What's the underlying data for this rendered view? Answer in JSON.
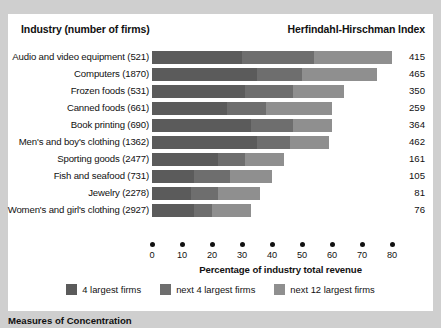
{
  "header": {
    "industry_title": "Industry (number of firms)",
    "hhi_title": "Herfindahl-Hirschman Index"
  },
  "caption": "Measures of Concentration",
  "legend": {
    "items": [
      {
        "label": "4 largest firms",
        "color": "#5b5b5b",
        "key": "top4"
      },
      {
        "label": "next 4 largest firms",
        "color": "#6e6e6e",
        "key": "next4"
      },
      {
        "label": "next 12 largest firms",
        "color": "#8f8f8f",
        "key": "next12"
      }
    ]
  },
  "chart_data": {
    "type": "bar",
    "orientation": "horizontal",
    "stacked": true,
    "title": "",
    "xlabel": "Percentage of industry total revenue",
    "ylabel": "",
    "xlim": [
      0,
      80
    ],
    "xticks": [
      0,
      10,
      20,
      30,
      40,
      50,
      60,
      70,
      80
    ],
    "grid": false,
    "legend_position": "bottom-center",
    "categories": [
      "Audio and video equipment  (521)",
      "Computers  (1870)",
      "Frozen foods  (531)",
      "Canned foods  (661)",
      "Book printing  (690)",
      "Men's and boy's clothing  (1362)",
      "Sporting goods  (2477)",
      "Fish and seafood  (731)",
      "Jewelry  (2278)",
      "Women's and girl's clothing  (2927)"
    ],
    "series": [
      {
        "name": "4 largest firms",
        "values": [
          30,
          35,
          31,
          25,
          33,
          35,
          22,
          14,
          13,
          14
        ]
      },
      {
        "name": "next 4 largest firms",
        "values": [
          24,
          15,
          16,
          13,
          14,
          11,
          9,
          12,
          9,
          6
        ]
      },
      {
        "name": "next 12 largest firms",
        "values": [
          26,
          25,
          17,
          22,
          13,
          13,
          13,
          14,
          14,
          13
        ]
      }
    ],
    "totals": [
      80,
      75,
      64,
      60,
      60,
      59,
      44,
      40,
      36,
      33
    ],
    "hhi_label": "Herfindahl-Hirschman Index",
    "hhi_values": [
      415,
      465,
      350,
      259,
      364,
      462,
      161,
      105,
      81,
      76
    ]
  }
}
